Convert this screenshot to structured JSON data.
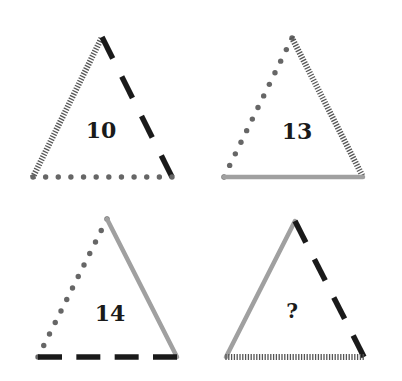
{
  "puzzle": {
    "type": "triangle number puzzle",
    "line_styles": {
      "hatched": {
        "color": "#555555",
        "description": "striped / hatched line"
      },
      "dashed": {
        "color": "#1a1a1a",
        "description": "long black dashes"
      },
      "dotted": {
        "color": "#666666",
        "description": "row of grey dots"
      },
      "solid": {
        "color": "#a0a0a0",
        "description": "solid light grey line"
      }
    },
    "triangles": [
      {
        "id": "top-left",
        "value": "10",
        "vertices": {
          "top": [
            102,
            37
          ],
          "left": [
            33,
            177
          ],
          "right": [
            172,
            177
          ]
        },
        "sides": {
          "left": "hatched",
          "right": "dashed",
          "bottom": "dotted"
        },
        "label_pos": [
          101,
          138
        ]
      },
      {
        "id": "top-right",
        "value": "13",
        "vertices": {
          "top": [
            292,
            38
          ],
          "left": [
            224,
            177
          ],
          "right": [
            363,
            177
          ]
        },
        "sides": {
          "left": "dotted",
          "right": "hatched",
          "bottom": "solid"
        },
        "label_pos": [
          297,
          139
        ]
      },
      {
        "id": "bottom-left",
        "value": "14",
        "vertices": {
          "top": [
            107,
            219
          ],
          "left": [
            38,
            357
          ],
          "right": [
            177,
            357
          ]
        },
        "sides": {
          "left": "dotted",
          "right": "solid",
          "bottom": "dashed"
        },
        "label_pos": [
          110,
          321
        ]
      },
      {
        "id": "bottom-right",
        "value": "?",
        "vertices": {
          "top": [
            295,
            221
          ],
          "left": [
            226,
            357
          ],
          "right": [
            364,
            357
          ]
        },
        "sides": {
          "left": "solid",
          "right": "dashed",
          "bottom": "hatched"
        },
        "label_pos": [
          292,
          318
        ]
      }
    ]
  }
}
